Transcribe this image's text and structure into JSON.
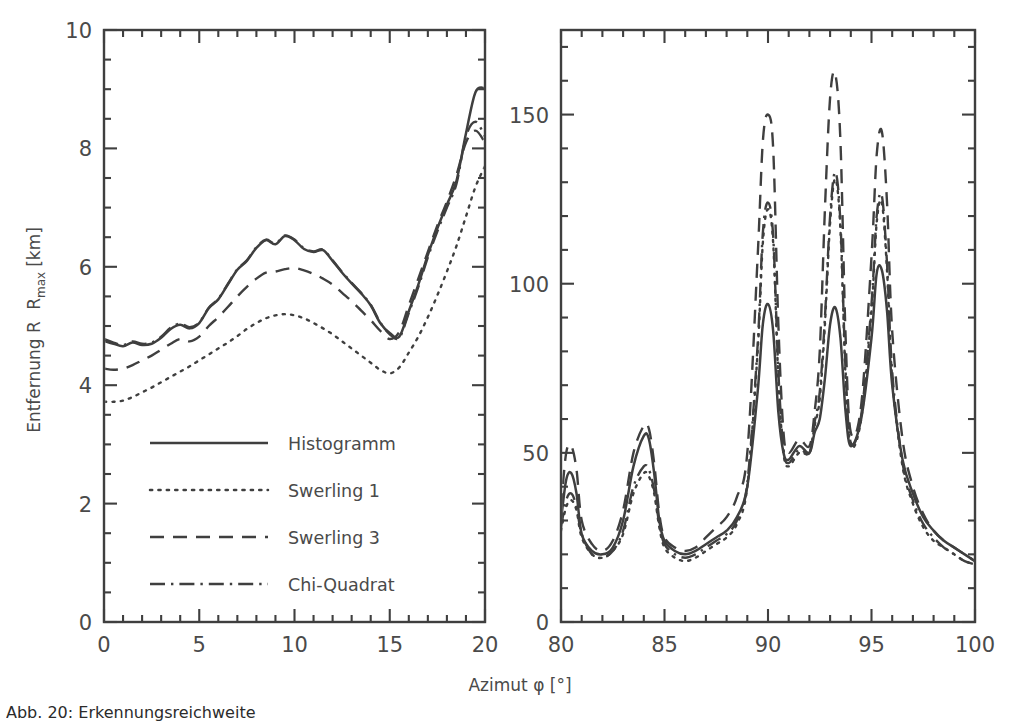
{
  "figure": {
    "kind": "two-panel line plot",
    "background": "#ffffff",
    "ink_color": "#3f3f3f",
    "caption_fragment": "Abb. 20:  Erkennungsreichweite"
  },
  "axis_labels": {
    "x": "Azimut φ [°]",
    "y_prefix": "Entfernung R",
    "y_sub": "max",
    "y_unit": "[km]",
    "y_full": "Entfernung R_max [km]"
  },
  "legend": {
    "position": "left-panel-lower-left",
    "items": [
      {
        "label": "Histogramm",
        "style": "solid",
        "color": "#3f3f3f"
      },
      {
        "label": "Swerling 1",
        "style": "dotted",
        "color": "#3f3f3f"
      },
      {
        "label": "Swerling 3",
        "style": "dashed",
        "color": "#3f3f3f"
      },
      {
        "label": "Chi-Quadrat",
        "style": "dashdot",
        "color": "#3f3f3f"
      }
    ]
  },
  "chart_data": [
    {
      "type": "line",
      "panel": "left",
      "title": "",
      "xlabel": "Azimut φ [°]",
      "ylabel": "Entfernung R_max [km]",
      "xlim": [
        0,
        20
      ],
      "ylim": [
        0,
        10
      ],
      "xticks": [
        0,
        5,
        10,
        15,
        20
      ],
      "xticklabels": [
        "0",
        "5",
        "10",
        "15",
        "20"
      ],
      "yticks": [
        0,
        2,
        4,
        6,
        8,
        10
      ],
      "yticklabels": [
        "0",
        "2",
        "4",
        "6",
        "8",
        "10"
      ],
      "minor_tick_count_x": 5,
      "minor_tick_count_y": 4,
      "grid": false,
      "legend_position": "lower left",
      "x": [
        0,
        0.5,
        1,
        1.5,
        2,
        2.5,
        3,
        3.5,
        4,
        4.5,
        5,
        5.5,
        6,
        6.5,
        7,
        7.5,
        8,
        8.5,
        9,
        9.5,
        10,
        10.5,
        11,
        11.5,
        12,
        12.5,
        13,
        13.5,
        14,
        14.5,
        15,
        15.5,
        16,
        16.5,
        17,
        17.5,
        18,
        18.5,
        19,
        19.5,
        20
      ],
      "series": [
        {
          "name": "Histogramm",
          "style": "solid",
          "values": [
            4.75,
            4.7,
            4.66,
            4.72,
            4.68,
            4.7,
            4.8,
            4.95,
            5.02,
            4.96,
            5.05,
            5.3,
            5.45,
            5.7,
            5.95,
            6.1,
            6.32,
            6.45,
            6.38,
            6.52,
            6.45,
            6.3,
            6.25,
            6.28,
            6.1,
            5.9,
            5.72,
            5.55,
            5.35,
            5.05,
            4.88,
            4.82,
            5.25,
            5.7,
            6.2,
            6.65,
            7.05,
            7.45,
            8.25,
            8.95,
            9.02
          ]
        },
        {
          "name": "Swerling 1",
          "style": "dotted",
          "values": [
            3.72,
            3.72,
            3.74,
            3.8,
            3.88,
            3.96,
            4.05,
            4.14,
            4.23,
            4.32,
            4.42,
            4.52,
            4.62,
            4.72,
            4.83,
            4.95,
            5.05,
            5.13,
            5.18,
            5.2,
            5.18,
            5.13,
            5.05,
            4.96,
            4.86,
            4.74,
            4.62,
            4.5,
            4.38,
            4.26,
            4.2,
            4.3,
            4.55,
            4.82,
            5.15,
            5.52,
            5.92,
            6.35,
            6.85,
            7.35,
            7.7
          ]
        },
        {
          "name": "Swerling 3",
          "style": "dashed",
          "values": [
            4.28,
            4.26,
            4.28,
            4.34,
            4.42,
            4.5,
            4.6,
            4.7,
            4.78,
            4.74,
            4.82,
            5.0,
            5.15,
            5.32,
            5.5,
            5.66,
            5.8,
            5.9,
            5.92,
            5.96,
            5.98,
            5.94,
            5.88,
            5.8,
            5.7,
            5.56,
            5.42,
            5.26,
            5.1,
            4.92,
            4.78,
            4.9,
            5.35,
            5.8,
            6.25,
            6.7,
            7.1,
            7.55,
            8.1,
            8.3,
            8.1
          ]
        },
        {
          "name": "Chi-Quadrat",
          "style": "dashdot",
          "values": [
            4.78,
            4.72,
            4.68,
            4.74,
            4.7,
            4.72,
            4.82,
            4.97,
            5.04,
            4.98,
            5.06,
            5.31,
            5.46,
            5.71,
            5.96,
            6.11,
            6.33,
            6.46,
            6.39,
            6.53,
            6.46,
            6.31,
            6.26,
            6.29,
            6.11,
            5.91,
            5.73,
            5.56,
            5.36,
            5.06,
            4.86,
            4.8,
            5.22,
            5.66,
            6.16,
            6.6,
            7.0,
            7.4,
            8.2,
            8.45,
            8.2
          ]
        }
      ]
    },
    {
      "type": "line",
      "panel": "right",
      "title": "",
      "xlabel": "Azimut φ [°]",
      "ylabel": "",
      "xlim": [
        80,
        100
      ],
      "ylim": [
        0,
        175
      ],
      "xticks": [
        80,
        85,
        90,
        95,
        100
      ],
      "xticklabels": [
        "80",
        "85",
        "90",
        "95",
        "100"
      ],
      "yticks": [
        0,
        50,
        100,
        150
      ],
      "yticklabels": [
        "0",
        "50",
        "100",
        "150"
      ],
      "minor_tick_count_x": 5,
      "minor_tick_count_y": 5,
      "grid": false,
      "x": [
        80,
        80.25,
        80.5,
        80.75,
        81,
        81.5,
        82,
        82.5,
        83,
        83.5,
        84,
        84.25,
        84.5,
        84.75,
        85,
        85.5,
        86,
        86.5,
        87,
        87.5,
        88,
        88.5,
        89,
        89.5,
        89.75,
        90,
        90.25,
        90.5,
        90.75,
        91,
        91.5,
        92,
        92.25,
        92.5,
        92.75,
        93,
        93.25,
        93.5,
        93.75,
        94,
        94.5,
        95,
        95.25,
        95.5,
        95.75,
        96,
        96.5,
        97,
        97.5,
        98,
        98.5,
        99,
        99.5,
        100
      ],
      "series": [
        {
          "name": "Histogramm",
          "style": "solid",
          "values": [
            30,
            42,
            44,
            38,
            26,
            21,
            20,
            22,
            30,
            46,
            55,
            54,
            44,
            30,
            24,
            21,
            20,
            21,
            23,
            25,
            27,
            31,
            40,
            68,
            88,
            94,
            86,
            62,
            50,
            48,
            52,
            50,
            56,
            60,
            72,
            88,
            93,
            84,
            62,
            52,
            60,
            84,
            103,
            104,
            92,
            70,
            48,
            38,
            31,
            27,
            24,
            22,
            20,
            18
          ]
        },
        {
          "name": "Swerling 1",
          "style": "dotted",
          "values": [
            27,
            34,
            36,
            33,
            25,
            20,
            19,
            21,
            26,
            38,
            44,
            43,
            38,
            28,
            22,
            19,
            18,
            19,
            21,
            23,
            25,
            29,
            40,
            80,
            112,
            122,
            112,
            72,
            50,
            46,
            50,
            50,
            58,
            66,
            88,
            118,
            131,
            116,
            72,
            52,
            60,
            92,
            118,
            124,
            104,
            72,
            46,
            35,
            28,
            24,
            22,
            20,
            18,
            17
          ]
        },
        {
          "name": "Swerling 3",
          "style": "dashed",
          "values": [
            34,
            50,
            52,
            45,
            30,
            23,
            21,
            24,
            33,
            50,
            58,
            57,
            47,
            32,
            25,
            22,
            21,
            22,
            25,
            28,
            31,
            37,
            50,
            108,
            142,
            150,
            140,
            88,
            56,
            50,
            54,
            52,
            62,
            80,
            122,
            155,
            162,
            142,
            84,
            56,
            64,
            108,
            138,
            145,
            124,
            86,
            54,
            40,
            32,
            27,
            24,
            22,
            20,
            18
          ]
        },
        {
          "name": "Chi-Quadrat",
          "style": "dashdot",
          "values": [
            28,
            36,
            38,
            34,
            26,
            20,
            19,
            21,
            27,
            40,
            46,
            45,
            39,
            29,
            23,
            20,
            19,
            20,
            22,
            24,
            26,
            30,
            41,
            82,
            115,
            124,
            114,
            74,
            51,
            47,
            51,
            50,
            59,
            68,
            90,
            120,
            133,
            118,
            74,
            53,
            61,
            94,
            120,
            126,
            106,
            74,
            47,
            36,
            29,
            25,
            22,
            20,
            18,
            17
          ]
        }
      ],
      "annotations": [
        "peaks near 80.5, 84.4, 90.2, 93.3 and 95.7 degrees"
      ]
    }
  ]
}
